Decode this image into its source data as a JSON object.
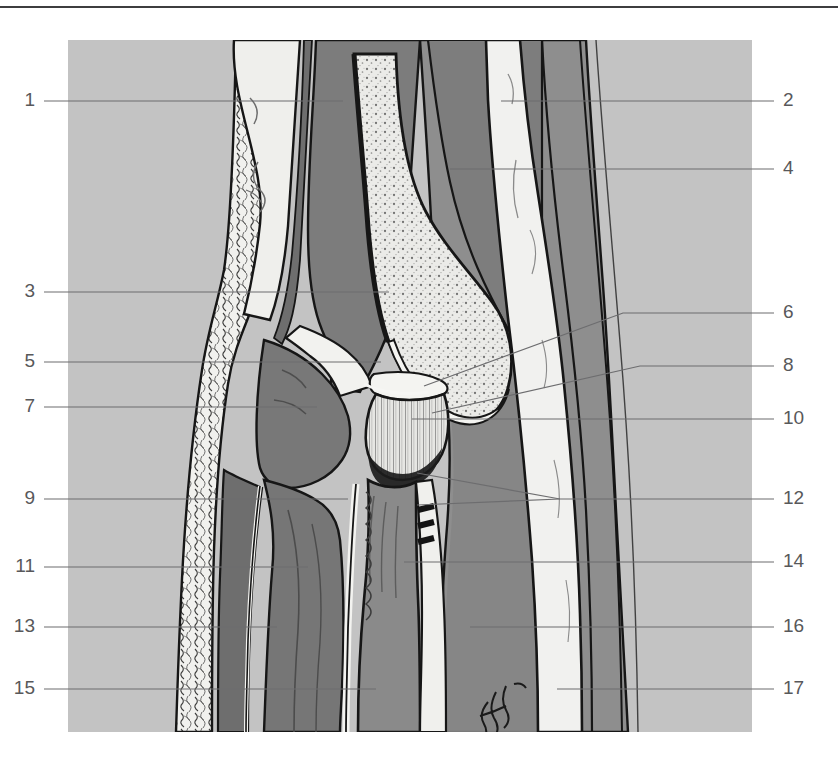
{
  "figure": {
    "kind": "anatomical-plate",
    "artist_signature": "Giolla",
    "panel": {
      "x": 68,
      "y": 40,
      "width": 684,
      "height": 692,
      "background_color": "#c3c3c3"
    },
    "colors": {
      "page_background": "#ffffff",
      "rule": "#3d3d3f",
      "panel_background": "#c3c3c3",
      "muscle_mid": "#8e8e8e",
      "muscle_dark": "#7b7b7b",
      "muscle_darker": "#6f6f6f",
      "bone_light": "#e9e9e7",
      "tendon_white": "#f2f2f0",
      "outline": "#161616",
      "label_text": "#58585a",
      "leader_line": "#6d6d6f"
    }
  },
  "labels": {
    "left": [
      {
        "id": "1",
        "text": "1",
        "x": 35,
        "y": 100,
        "line_from_x": 44,
        "line_to_x": 343,
        "line_y": 101
      },
      {
        "id": "3",
        "text": "3",
        "x": 35,
        "y": 291,
        "line_from_x": 44,
        "line_to_x": 389,
        "line_y": 292
      },
      {
        "id": "5",
        "text": "5",
        "x": 35,
        "y": 361,
        "line_from_x": 44,
        "line_to_x": 381,
        "line_y": 362
      },
      {
        "id": "7",
        "text": "7",
        "x": 35,
        "y": 406,
        "line_from_x": 44,
        "line_to_x": 317,
        "line_y": 407
      },
      {
        "id": "9",
        "text": "9",
        "x": 35,
        "y": 498,
        "line_from_x": 44,
        "line_to_x": 348,
        "line_y": 499
      },
      {
        "id": "11",
        "text": "11",
        "x": 35,
        "y": 566,
        "line_from_x": 44,
        "line_to_x": 308,
        "line_y": 567
      },
      {
        "id": "13",
        "text": "13",
        "x": 35,
        "y": 626,
        "line_from_x": 44,
        "line_to_x": 277,
        "line_y": 627
      },
      {
        "id": "15",
        "text": "15",
        "x": 35,
        "y": 688,
        "line_from_x": 44,
        "line_to_x": 376,
        "line_y": 689
      }
    ],
    "right": [
      {
        "id": "2",
        "text": "2",
        "x": 783,
        "y": 100,
        "line_from_x": 774,
        "line_to_x": 501,
        "line_y": 101
      },
      {
        "id": "4",
        "text": "4",
        "x": 783,
        "y": 168,
        "line_from_x": 774,
        "line_to_x": 450,
        "line_y": 169
      },
      {
        "id": "6",
        "text": "6",
        "x": 783,
        "y": 312,
        "line_from_x": 774,
        "line_to_x": 424,
        "line_y": 313
      },
      {
        "id": "8",
        "text": "8",
        "x": 783,
        "y": 365,
        "line_from_x": 774,
        "line_to_x": 432,
        "line_y": 366
      },
      {
        "id": "10",
        "text": "10",
        "x": 783,
        "y": 418,
        "line_from_x": 774,
        "line_to_x": 412,
        "line_y": 419
      },
      {
        "id": "12",
        "text": "12",
        "x": 783,
        "y": 498,
        "line_from_x": 774,
        "line_to_x": 420,
        "line_y": 499
      },
      {
        "id": "14",
        "text": "14",
        "x": 783,
        "y": 561,
        "line_from_x": 774,
        "line_to_x": 404,
        "line_y": 562
      },
      {
        "id": "16",
        "text": "16",
        "x": 783,
        "y": 626,
        "line_from_x": 774,
        "line_to_x": 470,
        "line_y": 627
      },
      {
        "id": "17",
        "text": "17",
        "x": 783,
        "y": 688,
        "line_from_x": 774,
        "line_to_x": 557,
        "line_y": 689
      }
    ]
  }
}
